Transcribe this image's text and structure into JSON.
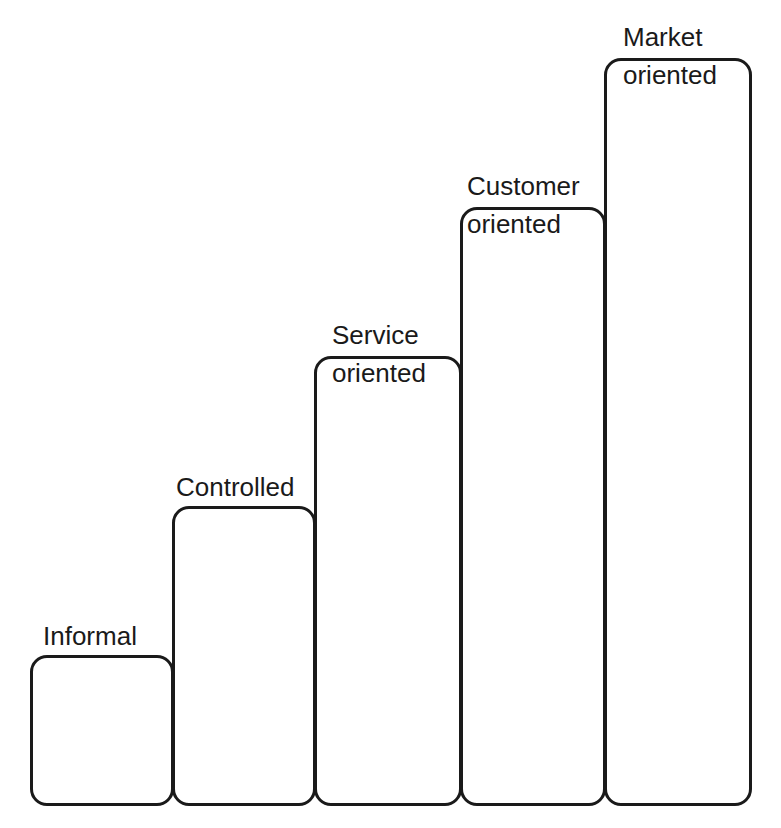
{
  "diagram": {
    "type": "staircase",
    "stroke_color": "#1a1a1a",
    "background": "#ffffff",
    "steps": [
      {
        "label_line1": "Informal",
        "label_line2": "",
        "level": 1
      },
      {
        "label_line1": "Controlled",
        "label_line2": "",
        "level": 2
      },
      {
        "label_line1": "Service",
        "label_line2": "oriented",
        "level": 3
      },
      {
        "label_line1": "Customer",
        "label_line2": "oriented",
        "level": 4
      },
      {
        "label_line1": "Market",
        "label_line2": "oriented",
        "level": 5
      }
    ]
  }
}
